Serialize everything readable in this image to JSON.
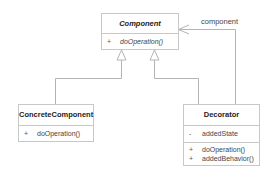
{
  "diagram": {
    "type": "UML class diagram",
    "classes": [
      {
        "name": "Component",
        "abstract": true,
        "attributes": [],
        "operations": [
          {
            "visibility": "+",
            "name": "doOperation()",
            "abstract": true
          }
        ]
      },
      {
        "name": "ConcreteComponent",
        "abstract": false,
        "attributes": [],
        "operations": [
          {
            "visibility": "+",
            "name": "doOperation()"
          }
        ]
      },
      {
        "name": "Decorator",
        "abstract": false,
        "attributes": [
          {
            "visibility": "-",
            "name": "addedState"
          }
        ],
        "operations": [
          {
            "visibility": "+",
            "name": "doOperation()"
          },
          {
            "visibility": "+",
            "name": "addedBehavior()"
          }
        ]
      }
    ],
    "relationships": [
      {
        "type": "generalization",
        "from": "ConcreteComponent",
        "to": "Component"
      },
      {
        "type": "generalization",
        "from": "Decorator",
        "to": "Component"
      },
      {
        "type": "association",
        "from": "Decorator",
        "to": "Component",
        "label": "component"
      }
    ],
    "colors": {
      "line": "#b4b4b4",
      "border": "#c8c8c8",
      "background": "#ffffff"
    }
  }
}
